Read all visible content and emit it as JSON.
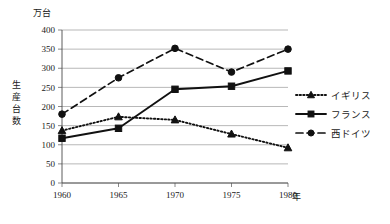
{
  "chart_data": {
    "type": "line",
    "title": "",
    "xlabel": "年",
    "ylabel": "生産台数",
    "yunit": "万台",
    "categories": [
      "1960",
      "1965",
      "1970",
      "1975",
      "1980"
    ],
    "x": [
      1960,
      1965,
      1970,
      1975,
      1980
    ],
    "ylim": [
      0,
      400
    ],
    "yticks": [
      "0",
      "50",
      "100",
      "150",
      "200",
      "250",
      "300",
      "350",
      "400"
    ],
    "ytick_values": [
      0,
      50,
      100,
      150,
      200,
      250,
      300,
      350,
      400
    ],
    "grid": true,
    "legend_position": "right",
    "series": [
      {
        "name": "イギリス",
        "values": [
          137,
          173,
          165,
          128,
          92
        ],
        "marker": "triangle",
        "linestyle": "dotted",
        "color": "#111111"
      },
      {
        "name": "フランス",
        "values": [
          117,
          143,
          245,
          253,
          293
        ],
        "marker": "square",
        "linestyle": "solid",
        "color": "#111111"
      },
      {
        "name": "西ドイツ",
        "values": [
          180,
          275,
          352,
          290,
          350
        ],
        "marker": "circle",
        "linestyle": "dashed",
        "color": "#111111"
      }
    ]
  },
  "axes": {
    "y_unit_label": "万台",
    "y_axis_title": "生産台数",
    "x_unit_label": "年"
  },
  "legend": {
    "items": [
      {
        "label": "イギリス"
      },
      {
        "label": "フランス"
      },
      {
        "label": "西ドイツ"
      }
    ]
  },
  "colors": {
    "ink": "#111111",
    "grid": "#9a9a9a",
    "axis": "#4a4a4a",
    "background": "#ffffff"
  }
}
